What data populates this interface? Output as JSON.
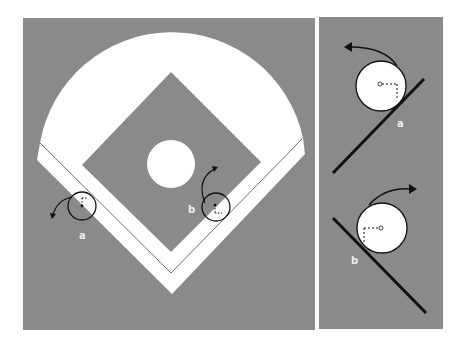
{
  "colors": {
    "field": "#8a8a8a",
    "white": "#ffffff",
    "line": "#1a1a1a"
  },
  "left_panel": {
    "labels": {
      "a": "a",
      "b": "b"
    }
  },
  "right_panel": {
    "labels": {
      "a": "a",
      "b": "b"
    }
  }
}
